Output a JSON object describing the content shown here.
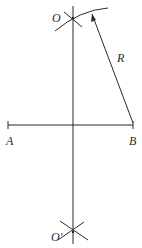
{
  "diagram": {
    "title": "",
    "labels": {
      "O": "O",
      "O_prime": "O'",
      "R": "R",
      "A": "A",
      "B": "B"
    },
    "points": {
      "A": [
        8,
        125
      ],
      "B": [
        133,
        125
      ],
      "O": [
        73,
        18
      ],
      "O_prime": [
        73,
        232
      ],
      "midpoint": [
        73,
        125
      ]
    },
    "elements": [
      "segment AB",
      "perpendicular bisector through O and O'",
      "arc of radius R centered at B through O",
      "radius line from B to arc with arrowhead",
      "intersection cross marks at O and O'"
    ],
    "stroke_color": "#2a2a2a",
    "background": "#ffffff"
  }
}
